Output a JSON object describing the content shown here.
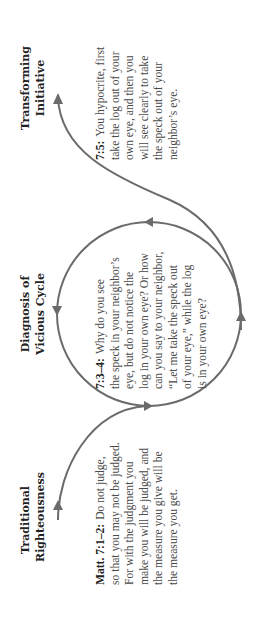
{
  "diagram": {
    "colors": {
      "line": "#6b6b6b",
      "heading_text": "#222222",
      "body_text": "#4a4a4a",
      "background": "#ffffff"
    },
    "stages": [
      {
        "id": "traditional",
        "heading_lines": [
          "Traditional",
          "Righteousness"
        ],
        "passage": {
          "ref": "Matt. 7:1–2:",
          "lines": [
            "Do not judge,",
            "so that you may not be judged.",
            "For with the judgment you",
            "make you will be judged, and",
            "the measure you give will be",
            "the measure you get."
          ]
        }
      },
      {
        "id": "diagnosis",
        "heading_lines": [
          "Diagnosis of",
          "Vicious Cycle"
        ],
        "passage": {
          "ref": "7:3–4:",
          "lines": [
            "Why do you see",
            "the speck in your neighbor’s",
            "eye, but do not notice the",
            "log in your own eye? Or how",
            "can you say to your neighbor,",
            "“Let me take the speck out",
            "of your eye,” while the log",
            "is in your own eye?"
          ]
        }
      },
      {
        "id": "transforming",
        "heading_lines": [
          "Transforming",
          "Initiative"
        ],
        "passage": {
          "ref": "7:5:",
          "lines": [
            "You hypocrite, first",
            "take the log out of your",
            "own eye, and then you",
            "will see clearly to take",
            "the speck out of your",
            "neighbor’s eye."
          ]
        }
      }
    ],
    "icons": {
      "cycle": "circular-arrow-cycle",
      "entry": "curved-arrow-entry",
      "exit": "curved-arrow-exit"
    }
  }
}
